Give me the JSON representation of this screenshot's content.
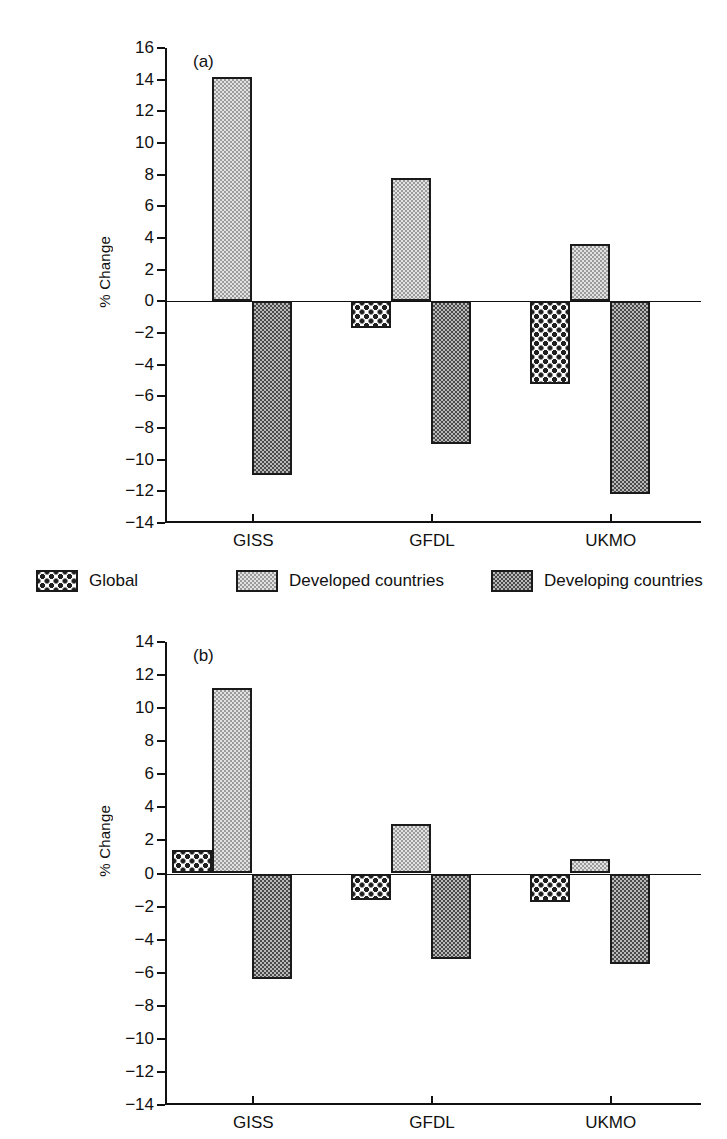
{
  "figure": {
    "ylabel": "% Change",
    "legend": {
      "position": "between-panels",
      "entries": [
        {
          "label": "Global",
          "pattern": "sparse-dark-dots",
          "color": "#202020"
        },
        {
          "label": "Developed countries",
          "pattern": "fine-light-checker",
          "color": "#9b9b9b"
        },
        {
          "label": "Developing countries",
          "pattern": "dense-dark-checker",
          "color": "#4a4a4a"
        }
      ]
    }
  },
  "chart_data": [
    {
      "type": "bar",
      "title": "",
      "panel_tag": "(a)",
      "xlabel": "",
      "ylabel": "% Change",
      "categories": [
        "GISS",
        "GFDL",
        "UKMO"
      ],
      "yticks": [
        16,
        14,
        12,
        10,
        8,
        6,
        4,
        2,
        0,
        -2,
        -4,
        -6,
        -8,
        -10,
        -12,
        -14
      ],
      "ytick_labels": [
        "16",
        "14",
        "12",
        "10",
        "8",
        "6",
        "4",
        "2",
        "0",
        "−2",
        "−4",
        "−6",
        "−8",
        "−10",
        "−12",
        "−14"
      ],
      "ylim": [
        -14,
        16
      ],
      "grid": false,
      "legend_position": "below",
      "series": [
        {
          "name": "Global",
          "values": [
            0.0,
            -1.7,
            -5.2
          ]
        },
        {
          "name": "Developed countries",
          "values": [
            14.2,
            7.8,
            3.6
          ]
        },
        {
          "name": "Developing countries",
          "values": [
            -11.0,
            -9.0,
            -12.2
          ]
        }
      ]
    },
    {
      "type": "bar",
      "title": "",
      "panel_tag": "(b)",
      "xlabel": "",
      "ylabel": "% Change",
      "categories": [
        "GISS",
        "GFDL",
        "UKMO"
      ],
      "yticks": [
        14,
        12,
        10,
        8,
        6,
        4,
        2,
        0,
        -2,
        -4,
        -6,
        -8,
        -10,
        -12,
        -14
      ],
      "ytick_labels": [
        "14",
        "12",
        "10",
        "8",
        "6",
        "4",
        "2",
        "0",
        "−2",
        "−4",
        "−6",
        "−8",
        "−10",
        "−12",
        "−14"
      ],
      "ylim": [
        -14,
        14
      ],
      "grid": false,
      "legend_position": "above",
      "series": [
        {
          "name": "Global",
          "values": [
            1.4,
            -1.6,
            -1.7
          ]
        },
        {
          "name": "Developed countries",
          "values": [
            11.2,
            3.0,
            0.9
          ]
        },
        {
          "name": "Developing countries",
          "values": [
            -6.4,
            -5.2,
            -5.5
          ]
        }
      ]
    }
  ]
}
